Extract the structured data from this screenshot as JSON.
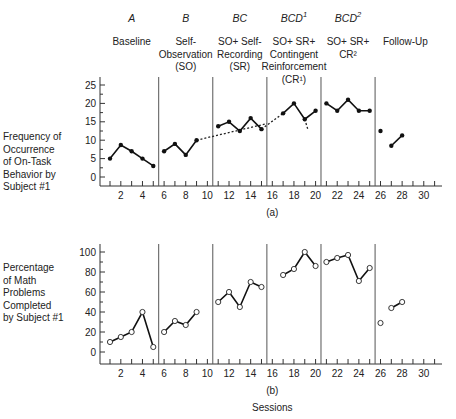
{
  "phases": [
    {
      "code": "A",
      "sup": "",
      "desc": [
        "Baseline"
      ]
    },
    {
      "code": "B",
      "sup": "",
      "desc": [
        "Self-",
        "Observation",
        "(SO)"
      ]
    },
    {
      "code": "BC",
      "sup": "",
      "desc": [
        "SO+ Self-",
        "Recording",
        "(SR)"
      ]
    },
    {
      "code": "BCD",
      "sup": "1",
      "desc": [
        "SO+ SR+",
        "Contingent",
        "Reinforcement",
        "(CR¹)"
      ]
    },
    {
      "code": "BCD",
      "sup": "2",
      "desc": [
        "SO+ SR+",
        "CR²"
      ]
    },
    {
      "code": "",
      "sup": "",
      "desc": [
        "Follow-Up"
      ]
    }
  ],
  "panel_a": {
    "ylabel": [
      "Frequency of",
      "Occurrence",
      "of On-Task",
      "Behavior by",
      "Subject #1"
    ],
    "caption": "(a)"
  },
  "panel_b": {
    "ylabel": [
      "Percentage",
      "of Math",
      "Problems",
      "Completed",
      "by Subject #1"
    ],
    "caption": "(b)"
  },
  "xlabel": "Sessions",
  "chart_data": [
    {
      "type": "line",
      "title": "(a)",
      "xlabel": "",
      "ylabel": "Frequency of Occurrence of On-Task Behavior by Subject #1",
      "ylim": [
        0,
        25
      ],
      "yticks": [
        0,
        5,
        10,
        15,
        20,
        25
      ],
      "xlim": [
        0,
        32
      ],
      "xticks": [
        2,
        4,
        6,
        8,
        10,
        12,
        14,
        16,
        18,
        20,
        22,
        24,
        26,
        28,
        30
      ],
      "phase_lines": [
        5.5,
        10.5,
        15.5,
        20.5,
        25.5
      ],
      "marker": "filled",
      "series": [
        {
          "name": "Baseline",
          "x": [
            1,
            2,
            3,
            4,
            5
          ],
          "y": [
            5,
            8.7,
            7,
            5,
            3
          ]
        },
        {
          "name": "Self-Observation",
          "x": [
            6,
            7,
            8,
            9
          ],
          "y": [
            7,
            9,
            6,
            10
          ]
        },
        {
          "name": "SO+SR",
          "x": [
            11,
            12,
            13,
            14,
            15
          ],
          "y": [
            13.8,
            15,
            12.5,
            16,
            13
          ]
        },
        {
          "name": "BCD1",
          "x": [
            17,
            18,
            19,
            20
          ],
          "y": [
            17.3,
            20,
            15.7,
            18
          ]
        },
        {
          "name": "BCD2",
          "x": [
            21,
            22,
            23,
            24,
            25
          ],
          "y": [
            20,
            18,
            21,
            18,
            18
          ]
        },
        {
          "name": "Follow-Up",
          "x": [
            26,
            27,
            28
          ],
          "y": [
            12.5,
            8.5,
            11.3
          ],
          "segments": [
            [
              26
            ],
            [
              27,
              28
            ]
          ]
        }
      ],
      "dashed_trends": [
        {
          "from": [
            9,
            10
          ],
          "to": [
            15.5,
            14.5
          ]
        },
        {
          "from": [
            15,
            13
          ],
          "to": [
            17,
            17.3
          ]
        },
        {
          "from": [
            19,
            15.7
          ],
          "to": [
            19.3,
            12.8
          ]
        }
      ],
      "grid": false
    },
    {
      "type": "line",
      "title": "(b)",
      "xlabel": "Sessions",
      "ylabel": "Percentage of Math Problems Completed by Subject #1",
      "ylim": [
        0,
        100
      ],
      "yticks": [
        0,
        20,
        40,
        60,
        80,
        100
      ],
      "xlim": [
        0,
        32
      ],
      "xticks": [
        2,
        4,
        6,
        8,
        10,
        12,
        14,
        16,
        18,
        20,
        22,
        24,
        26,
        28,
        30
      ],
      "phase_lines": [
        5.5,
        10.5,
        15.5,
        20.5,
        25.5
      ],
      "marker": "open",
      "series": [
        {
          "name": "Baseline",
          "x": [
            1,
            2,
            3,
            4,
            5
          ],
          "y": [
            10,
            15,
            20,
            40,
            5
          ]
        },
        {
          "name": "Self-Observation",
          "x": [
            6,
            7,
            8,
            9
          ],
          "y": [
            20,
            31,
            27,
            40
          ]
        },
        {
          "name": "SO+SR",
          "x": [
            11,
            12,
            13,
            14,
            15
          ],
          "y": [
            50,
            60,
            45,
            70,
            65
          ]
        },
        {
          "name": "BCD1",
          "x": [
            17,
            18,
            19,
            20
          ],
          "y": [
            77,
            83,
            100,
            86
          ]
        },
        {
          "name": "BCD2",
          "x": [
            21,
            22,
            23,
            24,
            25
          ],
          "y": [
            90,
            94,
            97,
            71,
            84
          ]
        },
        {
          "name": "Follow-Up",
          "x": [
            26,
            27,
            28
          ],
          "y": [
            29,
            44,
            50
          ],
          "segments": [
            [
              26
            ],
            [
              27,
              28
            ]
          ]
        }
      ],
      "grid": false
    }
  ]
}
